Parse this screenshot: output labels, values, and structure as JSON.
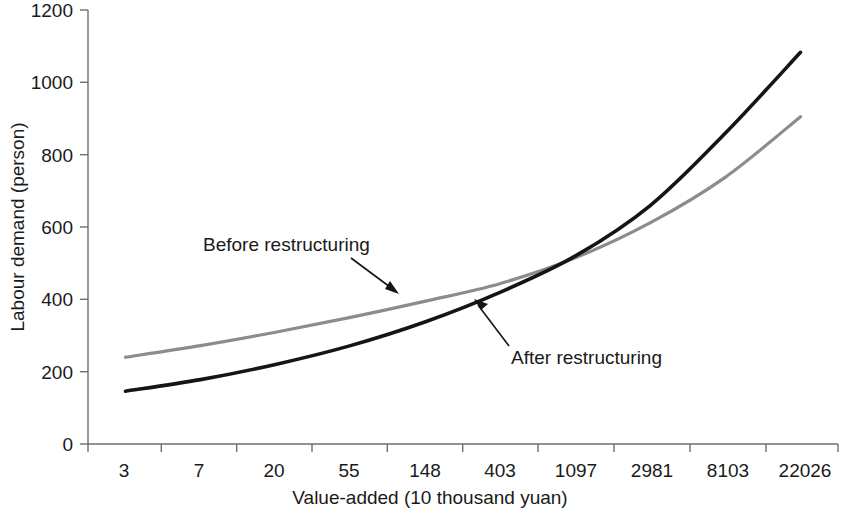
{
  "chart_data": {
    "type": "line",
    "title": "",
    "xlabel": "Value-added (10 thousand yuan)",
    "ylabel": "Labour demand (person)",
    "categories": [
      "3",
      "7",
      "20",
      "55",
      "148",
      "403",
      "1097",
      "2981",
      "8103",
      "22026"
    ],
    "xtick_labels": [
      "3",
      "7",
      "20",
      "55",
      "148",
      "403",
      "1097",
      "2981",
      "8103",
      "22026"
    ],
    "ytick_labels": [
      "0",
      "200",
      "400",
      "600",
      "800",
      "1000",
      "1200"
    ],
    "ytick_values": [
      0,
      200,
      400,
      600,
      800,
      1000,
      1200
    ],
    "ylim": [
      0,
      1200
    ],
    "grid": false,
    "legend_position": "inline-annotations",
    "series": [
      {
        "name": "Before restructuring",
        "color": "#8c8c8c",
        "values": [
          240,
          272,
          309,
          350,
          395,
          444,
          515,
          612,
          738,
          905
        ]
      },
      {
        "name": "After restructuring",
        "color": "#151515",
        "values": [
          146,
          178,
          220,
          272,
          338,
          420,
          520,
          660,
          860,
          1083
        ]
      }
    ],
    "annotations": [
      {
        "text": "Before restructuring",
        "series": "Before restructuring",
        "points_to_category": "148"
      },
      {
        "text": "After restructuring",
        "series": "After restructuring",
        "points_to_category": "403"
      }
    ]
  },
  "axes": {
    "y_title": "Labour demand (person)",
    "x_title": "Value-added (10 thousand yuan)"
  },
  "annotation_before": {
    "label": "Before restructuring"
  },
  "annotation_after": {
    "label": "After restructuring"
  },
  "ytick_0": "0",
  "ytick_1": "200",
  "ytick_2": "400",
  "ytick_3": "600",
  "ytick_4": "800",
  "ytick_5": "1000",
  "ytick_6": "1200",
  "xtick_0": "3",
  "xtick_1": "7",
  "xtick_2": "20",
  "xtick_3": "55",
  "xtick_4": "148",
  "xtick_5": "403",
  "xtick_6": "1097",
  "xtick_7": "2981",
  "xtick_8": "8103",
  "xtick_9": "22026"
}
